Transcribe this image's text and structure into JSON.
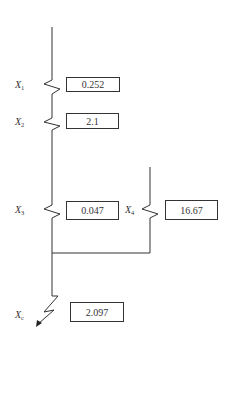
{
  "diagram": {
    "type": "reactance-equivalent-circuit",
    "elements": [
      {
        "label": "X",
        "sub": "1",
        "value": "0.252"
      },
      {
        "label": "X",
        "sub": "2",
        "value": "2.1"
      },
      {
        "label": "X",
        "sub": "3",
        "value": "0.047"
      },
      {
        "label": "X",
        "sub": "4",
        "value": "16.67"
      },
      {
        "label": "X",
        "sub": "c",
        "value": "2.097"
      }
    ],
    "connections": "X1 and X2 in series, X3 parallel with X4, result combined to fault point Xc"
  }
}
